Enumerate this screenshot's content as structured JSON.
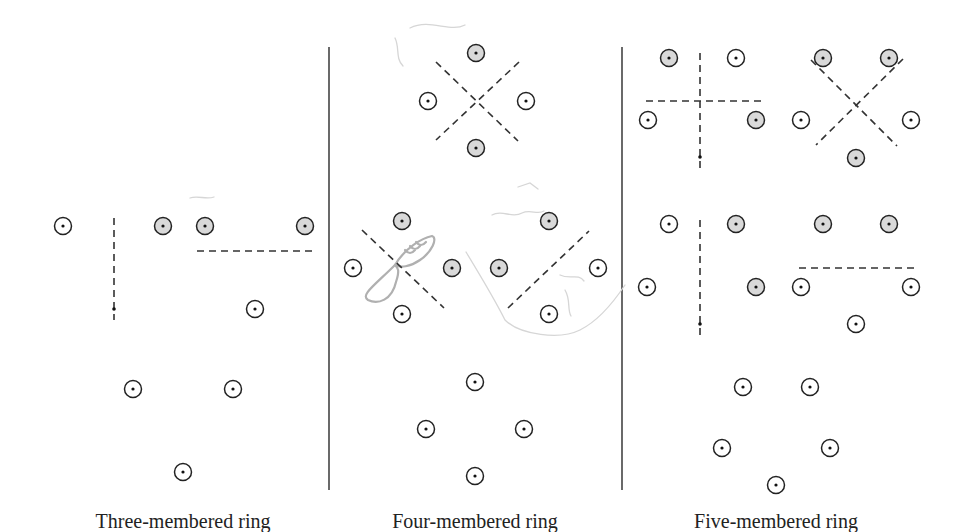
{
  "figure": {
    "panels": [
      {
        "id": "three",
        "label": "Three-membered ring",
        "patterns": [
          {
            "atoms": [
              {
                "kind": "open",
                "pos": [
                  63,
                  226
                ]
              },
              {
                "kind": "shaded",
                "pos": [
                  163,
                  226
                ]
              }
            ],
            "dashed_lines": [
              [
                [
                  114,
                  218
                ],
                [
                  114,
                  320
                ]
              ]
            ],
            "axis_dots": [
              [
                114,
                309
              ]
            ]
          },
          {
            "atoms": [
              {
                "kind": "shaded",
                "pos": [
                  205,
                  226
                ]
              },
              {
                "kind": "shaded",
                "pos": [
                  305,
                  226
                ]
              },
              {
                "kind": "open",
                "pos": [
                  255,
                  309
                ]
              }
            ],
            "dashed_lines": [
              [
                [
                  197,
                  251
                ],
                [
                  314,
                  251
                ]
              ]
            ],
            "axis_dots": []
          },
          {
            "atoms": [
              {
                "kind": "open",
                "pos": [
                  133,
                  389
                ]
              },
              {
                "kind": "open",
                "pos": [
                  233,
                  389
                ]
              },
              {
                "kind": "open",
                "pos": [
                  183,
                  472
                ]
              }
            ],
            "dashed_lines": [],
            "axis_dots": []
          }
        ]
      },
      {
        "id": "four",
        "label": "Four-membered ring",
        "patterns": [
          {
            "atoms": [
              {
                "kind": "shaded",
                "pos": [
                  476,
                  53
                ]
              },
              {
                "kind": "open",
                "pos": [
                  428,
                  101
                ]
              },
              {
                "kind": "open",
                "pos": [
                  526,
                  101
                ]
              },
              {
                "kind": "shaded",
                "pos": [
                  476,
                  148
                ]
              }
            ],
            "dashed_lines": [
              [
                [
                  436,
                  62
                ],
                [
                  518,
                  141
                ]
              ],
              [
                [
                  519,
                  62
                ],
                [
                  436,
                  140
                ]
              ]
            ],
            "axis_dots": []
          },
          {
            "atoms": [
              {
                "kind": "shaded",
                "pos": [
                  402,
                  221
                ]
              },
              {
                "kind": "open",
                "pos": [
                  353,
                  268
                ]
              },
              {
                "kind": "shaded",
                "pos": [
                  452,
                  268
                ]
              },
              {
                "kind": "open",
                "pos": [
                  402,
                  314
                ]
              }
            ],
            "dashed_lines": [
              [
                [
                  362,
                  230
                ],
                [
                  444,
                  308
                ]
              ]
            ],
            "axis_dots": []
          },
          {
            "atoms": [
              {
                "kind": "shaded",
                "pos": [
                  549,
                  221
                ]
              },
              {
                "kind": "shaded",
                "pos": [
                  499,
                  268
                ]
              },
              {
                "kind": "open",
                "pos": [
                  598,
                  268
                ]
              },
              {
                "kind": "open",
                "pos": [
                  549,
                  314
                ]
              }
            ],
            "dashed_lines": [
              [
                [
                  508,
                  308
                ],
                [
                  589,
                  231
                ]
              ]
            ],
            "axis_dots": []
          },
          {
            "atoms": [
              {
                "kind": "open",
                "pos": [
                  475,
                  382
                ]
              },
              {
                "kind": "open",
                "pos": [
                  426,
                  429
                ]
              },
              {
                "kind": "open",
                "pos": [
                  524,
                  429
                ]
              },
              {
                "kind": "open",
                "pos": [
                  475,
                  476
                ]
              }
            ],
            "dashed_lines": [],
            "axis_dots": []
          }
        ]
      },
      {
        "id": "five",
        "label": "Five-membered ring",
        "patterns": [
          {
            "atoms": [
              {
                "kind": "shaded",
                "pos": [
                  669,
                  58
                ]
              },
              {
                "kind": "open",
                "pos": [
                  736,
                  58
                ]
              },
              {
                "kind": "open",
                "pos": [
                  648,
                  120
                ]
              },
              {
                "kind": "shaded",
                "pos": [
                  756,
                  120
                ]
              }
            ],
            "dashed_lines": [
              [
                [
                  700,
                  53
                ],
                [
                  700,
                  168
                ]
              ],
              [
                [
                  646,
                  101
                ],
                [
                  762,
                  101
                ]
              ]
            ],
            "axis_dots": [
              [
                700,
                157
              ]
            ]
          },
          {
            "atoms": [
              {
                "kind": "shaded",
                "pos": [
                  823,
                  58
                ]
              },
              {
                "kind": "shaded",
                "pos": [
                  889,
                  58
                ]
              },
              {
                "kind": "open",
                "pos": [
                  801,
                  120
                ]
              },
              {
                "kind": "open",
                "pos": [
                  911,
                  120
                ]
              },
              {
                "kind": "shaded",
                "pos": [
                  856,
                  158
                ]
              }
            ],
            "dashed_lines": [
              [
                [
                  811,
                  60
                ],
                [
                  897,
                  146
                ]
              ],
              [
                [
                  903,
                  59
                ],
                [
                  816,
                  145
                ]
              ]
            ],
            "axis_dots": []
          },
          {
            "atoms": [
              {
                "kind": "open",
                "pos": [
                  669,
                  224
                ]
              },
              {
                "kind": "shaded",
                "pos": [
                  736,
                  224
                ]
              },
              {
                "kind": "open",
                "pos": [
                  647,
                  287
                ]
              },
              {
                "kind": "shaded",
                "pos": [
                  756,
                  287
                ]
              }
            ],
            "dashed_lines": [
              [
                [
                  700,
                  220
                ],
                [
                  700,
                  335
                ]
              ]
            ],
            "axis_dots": [
              [
                700,
                324
              ]
            ]
          },
          {
            "atoms": [
              {
                "kind": "shaded",
                "pos": [
                  823,
                  224
                ]
              },
              {
                "kind": "shaded",
                "pos": [
                  889,
                  224
                ]
              },
              {
                "kind": "open",
                "pos": [
                  801,
                  287
                ]
              },
              {
                "kind": "open",
                "pos": [
                  911,
                  287
                ]
              },
              {
                "kind": "open",
                "pos": [
                  856,
                  324
                ]
              }
            ],
            "dashed_lines": [
              [
                [
                  799,
                  268
                ],
                [
                  914,
                  268
                ]
              ]
            ],
            "axis_dots": []
          },
          {
            "atoms": [
              {
                "kind": "open",
                "pos": [
                  743,
                  387
                ]
              },
              {
                "kind": "open",
                "pos": [
                  810,
                  387
                ]
              },
              {
                "kind": "open",
                "pos": [
                  722,
                  448
                ]
              },
              {
                "kind": "open",
                "pos": [
                  830,
                  448
                ]
              },
              {
                "kind": "open",
                "pos": [
                  776,
                  485
                ]
              }
            ],
            "dashed_lines": [],
            "axis_dots": []
          }
        ]
      }
    ],
    "legend": {
      "open_atom": "atom p-orbital (unshaded lobe)",
      "shaded_atom": "atom p-orbital (shaded lobe)"
    },
    "colors": {
      "stroke": "#222222",
      "shaded_fill": "#d9d9d9",
      "pencil_marks": "#b0b0b0"
    },
    "annotations": [
      "handwritten pencil p-orbital sketch (four-membered ring panel)"
    ]
  }
}
